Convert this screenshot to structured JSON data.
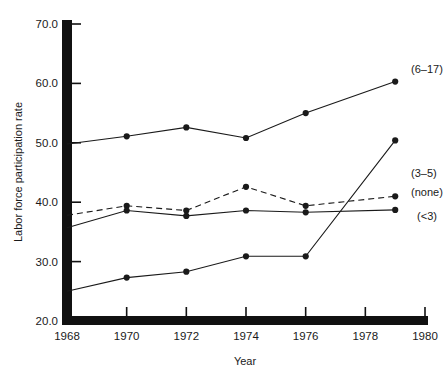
{
  "chart_data": {
    "type": "line",
    "title": "",
    "xlabel": "Year",
    "ylabel": "Labor force participation rate",
    "xlim": [
      1968,
      1980
    ],
    "ylim": [
      20.0,
      70.0
    ],
    "xticks": [
      1968,
      1970,
      1972,
      1974,
      1976,
      1978,
      1980
    ],
    "xtick_labels": [
      "1968",
      "1970",
      "1972",
      "1974",
      "1976",
      "1978",
      "1980"
    ],
    "yticks": [
      20.0,
      30.0,
      40.0,
      50.0,
      60.0,
      70.0
    ],
    "ytick_labels": [
      "20.0",
      "30.0",
      "40.0",
      "50.0",
      "60.0",
      "70.0"
    ],
    "grid": false,
    "legend_position": "right-inline-labels",
    "marker": "filled-circle",
    "series": [
      {
        "name": "(6-17)",
        "label": "(6–17)",
        "linestyle": "solid",
        "color": "#1a1a1a",
        "x": [
          1968,
          1970,
          1972,
          1974,
          1976,
          1979
        ],
        "values": [
          49.8,
          51.1,
          52.6,
          50.8,
          55.0,
          60.3
        ],
        "label_x": 1979.4,
        "label_y": 62.5
      },
      {
        "name": "(3-5)",
        "label": "(3–5)",
        "linestyle": "solid",
        "color": "#1a1a1a",
        "x": [
          1968,
          1970,
          1972,
          1974,
          1976,
          1979
        ],
        "values": [
          25.0,
          27.3,
          28.3,
          30.9,
          30.9,
          50.4
        ],
        "label_x": 1979.4,
        "label_y": 45.0
      },
      {
        "name": "(none)",
        "label": "(none)",
        "linestyle": "dashed",
        "color": "#1a1a1a",
        "x": [
          1968,
          1970,
          1972,
          1974,
          1976,
          1979
        ],
        "values": [
          37.8,
          39.4,
          38.6,
          42.6,
          39.4,
          41.0
        ],
        "label_x": 1979.4,
        "label_y": 41.8
      },
      {
        "name": "(<3)",
        "label": "(<3)",
        "linestyle": "solid",
        "color": "#1a1a1a",
        "x": [
          1968,
          1970,
          1972,
          1974,
          1976,
          1979
        ],
        "values": [
          35.7,
          38.6,
          37.7,
          38.6,
          38.3,
          38.7
        ],
        "label_x": 1979.6,
        "label_y": 37.6
      }
    ],
    "note": "The (3-5) solid line rises steeply after 1976 crossing the (none) and (<3) lines; the (<3) solid line runs nearly flat near 38 across the whole period."
  },
  "caption": {
    "partial_text": ""
  }
}
